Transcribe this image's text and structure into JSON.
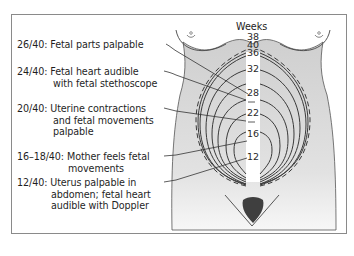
{
  "diagram": {
    "scale_title": "Weeks",
    "week_markers": [
      "38",
      "40",
      "36",
      "32",
      "28",
      "22",
      "16",
      "12"
    ],
    "annotations": [
      {
        "code": "26/40:",
        "line1": "Fetal parts palpable",
        "line2": ""
      },
      {
        "code": "24/40:",
        "line1": "Fetal heart audible",
        "line2": "with fetal stethoscope"
      },
      {
        "code": "20/40:",
        "line1": "Uterine contractions",
        "line2": "and fetal movements",
        "line3": "palpable"
      },
      {
        "code": "16–18/40:",
        "line1": "Mother feels fetal",
        "line2": "movements"
      },
      {
        "code": "12/40:",
        "line1": "Uterus palpable in",
        "line2": "abdomen; fetal heart",
        "line3": "audible with Doppler"
      }
    ],
    "colors": {
      "frame": "#8a8a8a",
      "torso_fill": "#d6d6d6",
      "contour": "#3a3a3a",
      "text": "#1f1f1f"
    }
  }
}
